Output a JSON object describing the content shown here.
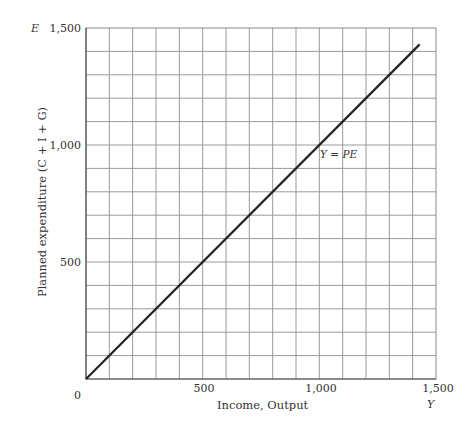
{
  "chart_data": {
    "type": "line",
    "title": "",
    "xlabel": "Income, Output",
    "ylabel": "Planned expenditure (C + I + G)",
    "x_axis_symbol": "Y",
    "y_axis_symbol": "E",
    "xlim": [
      0,
      1500
    ],
    "ylim": [
      0,
      1500
    ],
    "x_ticks": [
      "0",
      "500",
      "1,000",
      "1,500"
    ],
    "y_ticks": [
      "500",
      "1,000",
      "1,500"
    ],
    "grid": true,
    "grid_step": 100,
    "series": [
      {
        "name": "Y = PE",
        "x": [
          0,
          1430
        ],
        "y": [
          0,
          1430
        ],
        "color": "#222222"
      }
    ],
    "annotations": [
      {
        "text": "Y = PE",
        "x": 900,
        "y": 930
      }
    ]
  },
  "labels": {
    "origin": "0",
    "x500": "500",
    "x1000": "1,000",
    "x1500": "1,500",
    "y500": "500",
    "y1000": "1,000",
    "y1500": "1,500",
    "xlabel": "Income, Output",
    "ylabel": "Planned expenditure (C + I + G)",
    "xsym": "Y",
    "ysym": "E",
    "line_label": "Y = PE"
  }
}
